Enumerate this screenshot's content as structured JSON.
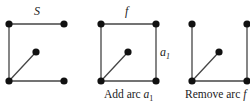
{
  "colors": {
    "edge": "#444444",
    "node": "#111111",
    "background": "#ffffff"
  },
  "graphs": [
    {
      "id": "graph-s",
      "top_label": "S",
      "side_label": null,
      "caption": null,
      "nodes": [
        [
          9,
          24
        ],
        [
          64,
          24
        ],
        [
          36,
          52
        ],
        [
          9,
          81
        ],
        [
          64,
          81
        ]
      ],
      "edges": [
        [
          0,
          1
        ],
        [
          0,
          3
        ],
        [
          3,
          2
        ],
        [
          3,
          4
        ]
      ]
    },
    {
      "id": "graph-add-arc",
      "top_label": "f",
      "side_label": {
        "base": "a",
        "sub": "1"
      },
      "caption": {
        "text": "Add arc ",
        "var": "a",
        "sub": "1"
      },
      "nodes": [
        [
          101,
          24
        ],
        [
          156,
          24
        ],
        [
          128,
          52
        ],
        [
          101,
          81
        ],
        [
          156,
          81
        ]
      ],
      "edges": [
        [
          0,
          1
        ],
        [
          0,
          3
        ],
        [
          3,
          2
        ],
        [
          3,
          4
        ],
        [
          1,
          4
        ]
      ]
    },
    {
      "id": "graph-remove-arc",
      "top_label": null,
      "side_label": null,
      "caption": {
        "text": "Remove arc ",
        "var": "f",
        "sub": null
      },
      "nodes": [
        [
          192,
          24
        ],
        [
          247,
          24
        ],
        [
          219,
          52
        ],
        [
          192,
          81
        ],
        [
          247,
          81
        ]
      ],
      "edges": [
        [
          0,
          3
        ],
        [
          3,
          2
        ],
        [
          3,
          4
        ],
        [
          1,
          4
        ]
      ]
    }
  ]
}
